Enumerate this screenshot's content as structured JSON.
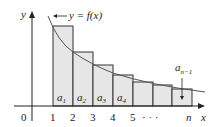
{
  "diagram": {
    "curve_label": "y = f(x)",
    "axes": {
      "x_label": "x",
      "y_label": "y",
      "origin_label": "0",
      "x_ticks": [
        "1",
        "2",
        "3",
        "4",
        "5",
        "· · ·",
        "n"
      ]
    },
    "rectangles": [
      {
        "label": "a",
        "sub": "1",
        "from": 1,
        "to": 2
      },
      {
        "label": "a",
        "sub": "2",
        "from": 2,
        "to": 3
      },
      {
        "label": "a",
        "sub": "3",
        "from": 3,
        "to": 4
      },
      {
        "label": "a",
        "sub": "4",
        "from": 4,
        "to": 5
      },
      {
        "label": "",
        "sub": "",
        "from": 5,
        "to": 6
      },
      {
        "label": "",
        "sub": "",
        "from": 6,
        "to": 7
      },
      {
        "label": "",
        "sub": "",
        "from": 7,
        "to": 8
      }
    ],
    "last_label": {
      "label": "a",
      "sub": "n−1"
    },
    "colors": {
      "rect_fill": "#e6e6e6",
      "rect_stroke": "#333333",
      "curve": "#555555",
      "axis": "#222222"
    }
  }
}
